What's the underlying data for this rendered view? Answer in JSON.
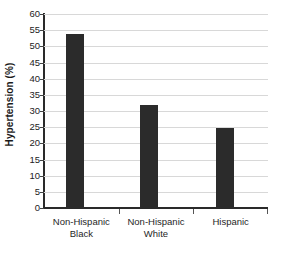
{
  "chart_data": {
    "type": "bar",
    "title": "",
    "xlabel": "",
    "ylabel": "Hypertension (%)",
    "categories": [
      "Non-Hispanic Black",
      "Non-Hispanic White",
      "Hispanic"
    ],
    "category_lines": [
      [
        "Non-Hispanic",
        "Black"
      ],
      [
        "Non-Hispanic",
        "White"
      ],
      [
        "Hispanic",
        ""
      ]
    ],
    "values": [
      53.9,
      31.9,
      24.8
    ],
    "ylim": [
      0,
      60
    ],
    "ytick_step": 5,
    "yticks": [
      0,
      5,
      10,
      15,
      20,
      25,
      30,
      35,
      40,
      45,
      50,
      55,
      60
    ],
    "ytick_labels": [
      "0",
      "5",
      "10",
      "15",
      "20",
      "25",
      "30",
      "35",
      "40",
      "45",
      "50",
      "55",
      "60"
    ],
    "grid": true,
    "grid_axis": "y",
    "legend": false,
    "legend_position": "none",
    "bar_color": "#2b2b2b",
    "grid_color": "#d8d8d8",
    "axis_color": "#2a2a2a",
    "background_color": "#ffffff"
  }
}
